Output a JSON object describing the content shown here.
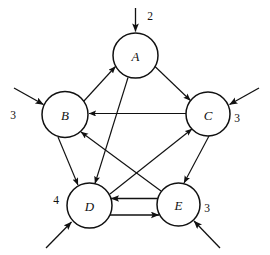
{
  "diagram": {
    "type": "directed-graph",
    "nodes": [
      {
        "id": "A",
        "label": "A",
        "cx": 135.5,
        "cy": 55.5,
        "r": 22.5
      },
      {
        "id": "B",
        "label": "B",
        "cx": 65.0,
        "cy": 114.5,
        "r": 23.0
      },
      {
        "id": "C",
        "label": "C",
        "cx": 208.0,
        "cy": 114.0,
        "r": 22.0
      },
      {
        "id": "D",
        "label": "D",
        "cx": 89.5,
        "cy": 205.5,
        "r": 22.5
      },
      {
        "id": "E",
        "label": "E",
        "cx": 178.5,
        "cy": 204.5,
        "r": 21.5
      }
    ],
    "edges": [
      {
        "from": "B",
        "to": "A",
        "kind": "internal"
      },
      {
        "from": "A",
        "to": "C",
        "kind": "internal"
      },
      {
        "from": "C",
        "to": "B",
        "kind": "internal"
      },
      {
        "from": "B",
        "to": "D",
        "kind": "internal"
      },
      {
        "from": "A",
        "to": "D",
        "kind": "internal"
      },
      {
        "from": "D",
        "to": "C",
        "kind": "internal"
      },
      {
        "from": "C",
        "to": "E",
        "kind": "internal"
      },
      {
        "from": "E",
        "to": "B",
        "kind": "internal"
      },
      {
        "from": "E",
        "to": "D",
        "kind": "internal-parallel-top"
      },
      {
        "from": "D",
        "to": "E",
        "kind": "internal-parallel-bottom"
      }
    ],
    "external_inputs": [
      {
        "target": "A",
        "label": "2",
        "direction": "from-top",
        "label_x": 150,
        "label_y": 16
      },
      {
        "target": "B",
        "label": "3",
        "direction": "from-upper-left",
        "label_x": 13,
        "label_y": 115
      },
      {
        "target": "C",
        "label": "3",
        "direction": "from-upper-right",
        "label_x": 237,
        "label_y": 118
      },
      {
        "target": "D",
        "label": "4",
        "direction": "from-lower-left",
        "label_x": 56,
        "label_y": 200
      },
      {
        "target": "E",
        "label": "3",
        "direction": "from-lower-right",
        "label_x": 207,
        "label_y": 208
      }
    ],
    "colors": {
      "stroke": "#111111",
      "background": "#ffffff",
      "node_fill": "#ffffff"
    }
  }
}
